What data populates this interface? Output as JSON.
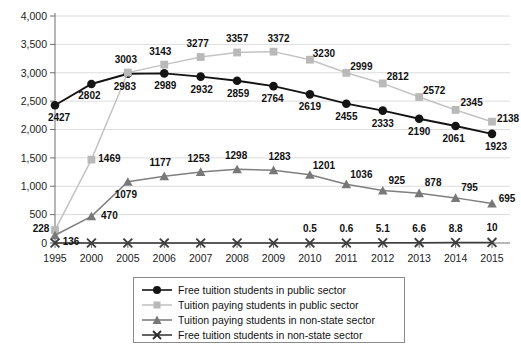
{
  "chart_data": {
    "type": "line",
    "title": "",
    "subtitle": "",
    "xlabel": "",
    "ylabel": "",
    "grid": true,
    "legend_position": "bottom",
    "ylim": [
      0,
      4000
    ],
    "ytick_labels": [
      "0",
      "500",
      "1,000",
      "1,500",
      "2,000",
      "2,500",
      "3,000",
      "3,500",
      "4,000"
    ],
    "ytick_values": [
      0,
      500,
      1000,
      1500,
      2000,
      2500,
      3000,
      3500,
      4000
    ],
    "categories": [
      "1995",
      "2000",
      "2005",
      "2006",
      "2007",
      "2008",
      "2009",
      "2010",
      "2011",
      "2012",
      "2013",
      "2014",
      "2015"
    ],
    "series": [
      {
        "name": "Free tuition students in public sector",
        "marker": "circle",
        "color": "#141414",
        "line_color": "#141414",
        "values": [
          2427,
          2802,
          2983,
          2989,
          2932,
          2859,
          2764,
          2619,
          2455,
          2333,
          2190,
          2061,
          1923
        ],
        "labels": [
          "2427",
          "2802",
          "2983",
          "2989",
          "2932",
          "2859",
          "2764",
          "2619",
          "2455",
          "2333",
          "2190",
          "2061",
          "1923"
        ]
      },
      {
        "name": "Tuition paying students in public sector",
        "marker": "square",
        "color": "#b9b9b9",
        "line_color": "#c3c3c3",
        "values": [
          228,
          1469,
          3003,
          3143,
          3277,
          3357,
          3372,
          3230,
          2999,
          2812,
          2572,
          2345,
          2138
        ],
        "labels": [
          "228",
          "1469",
          "3003",
          "3143",
          "3277",
          "3357",
          "3372",
          "3230",
          "2999",
          "2812",
          "2572",
          "2345",
          "2138"
        ]
      },
      {
        "name": "Tuition paying students in non-state sector",
        "marker": "triangle",
        "color": "#787878",
        "line_color": "#7f7f7f",
        "values": [
          136,
          470,
          1079,
          1177,
          1253,
          1298,
          1283,
          1201,
          1036,
          925,
          878,
          795,
          695
        ],
        "labels": [
          "136",
          "470",
          "1079",
          "1177",
          "1253",
          "1298",
          "1283",
          "1201",
          "1036",
          "925",
          "878",
          "795",
          "695"
        ]
      },
      {
        "name": "Free tuition students in non-state sector",
        "marker": "x",
        "color": "#3d3d3d",
        "line_color": "#3d3d3d",
        "values": [
          0,
          0,
          0,
          0,
          0,
          0,
          0,
          0.5,
          0.6,
          5.1,
          6.6,
          8.8,
          10
        ],
        "labels": [
          "",
          "",
          "",
          "",
          "",
          "",
          "",
          "0.5",
          "0.6",
          "5.1",
          "6.6",
          "8.8",
          "10"
        ]
      }
    ]
  },
  "legend": {
    "items": [
      {
        "label": "Free tuition students in public sector",
        "marker": "circle"
      },
      {
        "label": "Tuition paying students in public sector",
        "marker": "square"
      },
      {
        "label": "Tuition paying students in non-state sector",
        "marker": "triangle"
      },
      {
        "label": "Free tuition students in non-state sector",
        "marker": "x"
      }
    ]
  }
}
